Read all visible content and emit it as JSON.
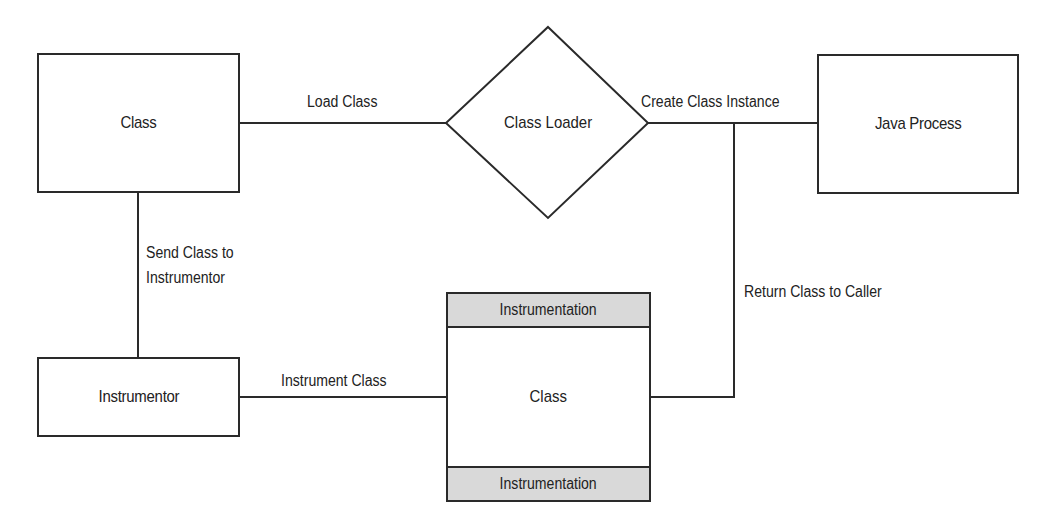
{
  "diagram": {
    "title": "",
    "nodes": {
      "class": {
        "label": "Class",
        "shape": "rectangle"
      },
      "class_loader": {
        "label": "Class Loader",
        "shape": "diamond"
      },
      "java_process": {
        "label": "Java Process",
        "shape": "rectangle"
      },
      "instrumentor": {
        "label": "Instrumentor",
        "shape": "rectangle"
      },
      "instrumented_class": {
        "label": "Class",
        "shape": "rectangle-with-bands",
        "top_band": "Instrumentation",
        "bottom_band": "Instrumentation"
      }
    },
    "edges": {
      "load_class": {
        "label": "Load Class",
        "from": "Class",
        "to": "Class Loader"
      },
      "create_instance": {
        "label": "Create Class Instance",
        "from": "Class Loader",
        "to": "Java Process"
      },
      "send_to_instrumentor": {
        "line1": "Send Class to",
        "line2": "Instrumentor",
        "from": "Class",
        "to": "Instrumentor"
      },
      "instrument_class": {
        "label": "Instrument Class",
        "from": "Instrumentor",
        "to": "Class (instrumented)"
      },
      "return_to_caller": {
        "label": "Return Class to Caller",
        "from": "Class (instrumented)",
        "to": "Java Process"
      }
    },
    "colors": {
      "stroke": "#2a2a2a",
      "band_fill": "#d9d9d9",
      "background": "#ffffff"
    }
  }
}
